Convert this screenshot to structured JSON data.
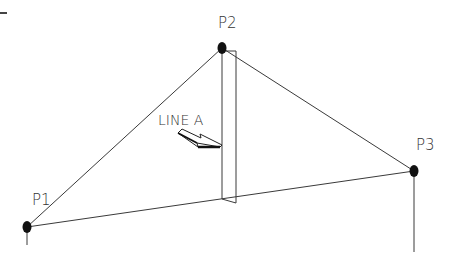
{
  "diagram": {
    "type": "truss-schematic",
    "colors": {
      "line": "#3a3a3a",
      "point": "#111111",
      "text": "#333333",
      "background": "#ffffff"
    },
    "points": [
      {
        "id": "P1",
        "label": "P1",
        "x": 27,
        "y": 227
      },
      {
        "id": "P2",
        "label": "P2",
        "x": 222,
        "y": 48
      },
      {
        "id": "P3",
        "label": "P3",
        "x": 414,
        "y": 171
      }
    ],
    "edges": [
      {
        "from": "P1",
        "to": "P2"
      },
      {
        "from": "P2",
        "to": "P3"
      },
      {
        "from": "P1",
        "to": "P3"
      }
    ],
    "member": {
      "label": "LINE A",
      "description": "vertical member from P2 down to base line P1-P3"
    },
    "callout": {
      "text": "LINE A",
      "pointer": "arrow pointing to vertical member"
    }
  }
}
